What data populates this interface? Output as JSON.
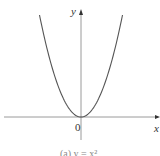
{
  "chart_data": {
    "type": "line",
    "title": "",
    "caption": "(a) y = x²",
    "function": "y = x^2",
    "xlabel": "x",
    "ylabel": "y",
    "origin_label": "0",
    "x": [
      -1.0,
      -0.75,
      -0.5,
      -0.25,
      0,
      0.25,
      0.5,
      0.75,
      1.0
    ],
    "series": [
      {
        "name": "y = x^2",
        "values": [
          1.0,
          0.5625,
          0.25,
          0.0625,
          0,
          0.0625,
          0.25,
          0.5625,
          1.0
        ]
      }
    ],
    "grid": false,
    "legend": "none",
    "colors": {
      "curve": "#555555",
      "axes": "#999999",
      "text": "#333333"
    }
  },
  "labels": {
    "y_axis": "y",
    "x_axis": "x",
    "origin": "0",
    "caption": "(a) y = x²"
  }
}
